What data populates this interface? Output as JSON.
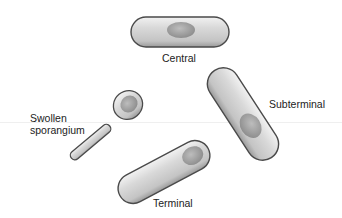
{
  "figure": {
    "type": "bacterial endospore positions",
    "colors": {
      "background": "#ffffff",
      "cell_fill": "#cfcfcf",
      "cell_highlight": "#eeeeee",
      "cell_outline": "#4a4a4a",
      "spore_fill": "#a6a6a6",
      "label_text": "#222222"
    },
    "cells": [
      {
        "id": "central",
        "label": "Central"
      },
      {
        "id": "subterminal",
        "label": "Subterminal"
      },
      {
        "id": "swollen-sporangium",
        "label_line1": "Swollen",
        "label_line2": "sporangium"
      },
      {
        "id": "terminal",
        "label": "Terminal"
      }
    ]
  }
}
